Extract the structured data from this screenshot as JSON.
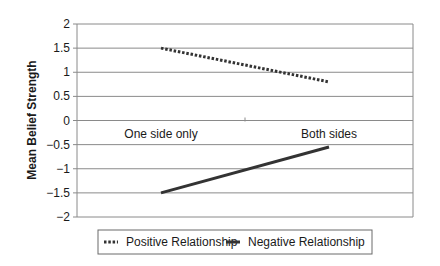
{
  "chart_data": {
    "type": "line",
    "title": "",
    "xlabel": "",
    "ylabel": "Mean Belief Strength",
    "categories": [
      "One side only",
      "Both sides"
    ],
    "series": [
      {
        "name": "Positive Relationship",
        "values": [
          1.5,
          0.8
        ],
        "style": "dotted",
        "color": "#333333"
      },
      {
        "name": "Negative Relationship",
        "values": [
          -1.5,
          -0.55
        ],
        "style": "solid",
        "color": "#333333"
      }
    ],
    "ylim": [
      -2,
      2
    ],
    "yticks": [
      "2",
      "1.5",
      "1",
      "0.5",
      "0",
      "-0.5",
      "-1",
      "-1.5",
      "-2"
    ],
    "ytick_values": [
      2,
      1.5,
      1,
      0.5,
      0,
      -0.5,
      -1,
      -1.5,
      -2
    ],
    "grid": true,
    "legend_position": "bottom"
  }
}
